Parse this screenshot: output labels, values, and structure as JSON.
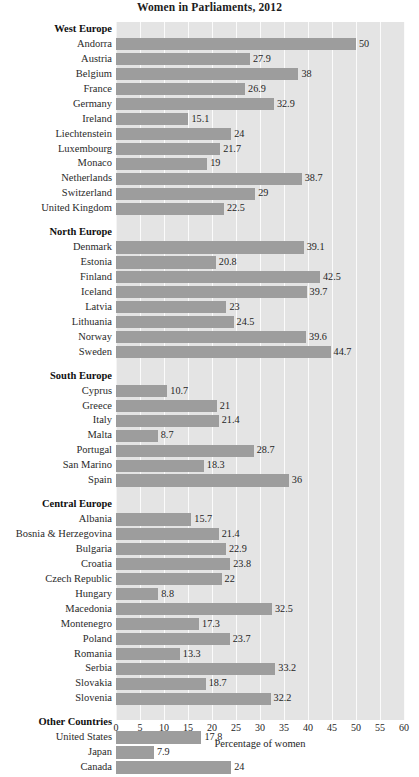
{
  "chart_data": {
    "type": "bar",
    "orientation": "horizontal",
    "title": "Women in Parliaments, 2012",
    "xlabel": "Percentage of women",
    "ylabel": "",
    "xlim": [
      0,
      60
    ],
    "xticks": [
      0,
      5,
      10,
      15,
      20,
      25,
      30,
      35,
      40,
      45,
      50,
      55,
      60
    ],
    "grid": true,
    "legend": false,
    "bar_color": "#9d9d9d",
    "plot_background": "#e4e4e4",
    "gridline_color": "#fbfbfb",
    "groups": [
      {
        "name": "West Europe",
        "categories": [
          "Andorra",
          "Austria",
          "Belgium",
          "France",
          "Germany",
          "Ireland",
          "Liechtenstein",
          "Luxembourg",
          "Monaco",
          "Netherlands",
          "Switzerland",
          "United Kingdom"
        ],
        "values": [
          50,
          27.9,
          38,
          26.9,
          32.9,
          15.1,
          24,
          21.7,
          19,
          38.7,
          29,
          22.5
        ]
      },
      {
        "name": "North Europe",
        "categories": [
          "Denmark",
          "Estonia",
          "Finland",
          "Iceland",
          "Latvia",
          "Lithuania",
          "Norway",
          "Sweden"
        ],
        "values": [
          39.1,
          20.8,
          42.5,
          39.7,
          23,
          24.5,
          39.6,
          44.7
        ]
      },
      {
        "name": "South Europe",
        "categories": [
          "Cyprus",
          "Greece",
          "Italy",
          "Malta",
          "Portugal",
          "San Marino",
          "Spain"
        ],
        "values": [
          10.7,
          21,
          21.4,
          8.7,
          28.7,
          18.3,
          36
        ]
      },
      {
        "name": "Central Europe",
        "categories": [
          "Albania",
          "Bosnia & Herzegovina",
          "Bulgaria",
          "Croatia",
          "Czech Republic",
          "Hungary",
          "Macedonia",
          "Montenegro",
          "Poland",
          "Romania",
          "Serbia",
          "Slovakia",
          "Slovenia"
        ],
        "values": [
          15.7,
          21.4,
          22.9,
          23.8,
          22,
          8.8,
          32.5,
          17.3,
          23.7,
          13.3,
          33.2,
          18.7,
          32.2
        ]
      },
      {
        "name": "Other Countries",
        "categories": [
          "United States",
          "Japan",
          "Canada"
        ],
        "values": [
          17.8,
          7.9,
          24
        ]
      }
    ]
  }
}
